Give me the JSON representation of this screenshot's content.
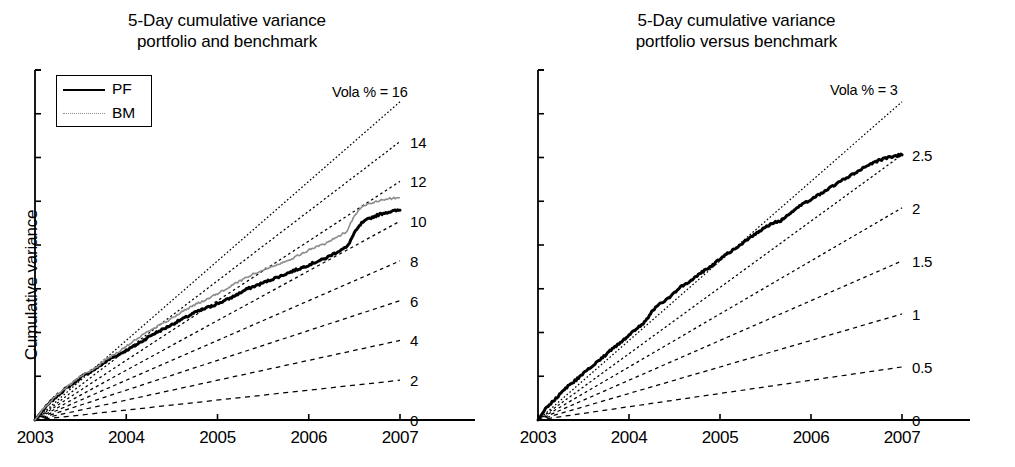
{
  "figure": {
    "background": "#ffffff",
    "ink_color": "#000000",
    "benchmark_color": "#8d8d8d"
  },
  "panels": [
    {
      "id": "left",
      "title": "5-Day cumulative variance\nportfolio and benchmark",
      "ylabel": "Cumulative variance",
      "legend": {
        "items": [
          {
            "label": "PF",
            "style": "solid",
            "color": "#000000"
          },
          {
            "label": "BM",
            "style": "dotted",
            "color": "#8d8d8d"
          }
        ]
      },
      "vola_head_label": "Vola % = 16",
      "vola_labels": [
        "14",
        "12",
        "10",
        "8",
        "6",
        "4",
        "2",
        "0"
      ]
    },
    {
      "id": "right",
      "title": "5-Day cumulative variance\nportfolio versus benchmark",
      "ylabel": "Cumulative variance",
      "vola_head_label": "Vola % = 3",
      "vola_labels": [
        "2.5",
        "2",
        "1.5",
        "1",
        "0.5",
        "0"
      ]
    }
  ],
  "chart_data": [
    {
      "type": "line",
      "panel": "left",
      "title": "5-Day cumulative variance portfolio and benchmark",
      "xlabel": "",
      "ylabel": "Cumulative variance",
      "xticklabels": [
        "2003",
        "2004",
        "2005",
        "2006",
        "2007"
      ],
      "x": [
        2003,
        2004,
        2005,
        2006,
        2007
      ],
      "xlim": [
        2003,
        2007
      ],
      "ylim": [
        0,
        16
      ],
      "yticklabels": [],
      "grid": false,
      "legend_position": "upper-left",
      "annotations": [
        {
          "text": "Vola % = 16",
          "value": 16
        },
        {
          "text": "14",
          "value": 14
        },
        {
          "text": "12",
          "value": 12
        },
        {
          "text": "10",
          "value": 10
        },
        {
          "text": "8",
          "value": 8
        },
        {
          "text": "6",
          "value": 6
        },
        {
          "text": "4",
          "value": 4
        },
        {
          "text": "2",
          "value": 2
        },
        {
          "text": "0",
          "value": 0
        }
      ],
      "reference_lines": {
        "description": "Dashed straight iso-volatility reference lines from origin",
        "style": "dashed",
        "vola_levels": [
          16,
          14,
          12,
          10,
          8,
          6,
          4,
          2
        ],
        "end_values": [
          16,
          14,
          12,
          10,
          8,
          6,
          4,
          2
        ]
      },
      "series": [
        {
          "name": "PF",
          "style": "solid",
          "color": "#000000",
          "x": [
            2003.0,
            2003.08,
            2003.17,
            2003.25,
            2003.33,
            2003.42,
            2003.5,
            2003.58,
            2003.67,
            2003.75,
            2003.83,
            2003.92,
            2004.0,
            2004.08,
            2004.17,
            2004.25,
            2004.33,
            2004.42,
            2004.5,
            2004.58,
            2004.67,
            2004.75,
            2004.83,
            2004.92,
            2005.0,
            2005.08,
            2005.17,
            2005.25,
            2005.33,
            2005.42,
            2005.5,
            2005.58,
            2005.67,
            2005.75,
            2005.83,
            2005.92,
            2006.0,
            2006.08,
            2006.17,
            2006.25,
            2006.33,
            2006.42,
            2006.5,
            2006.58,
            2006.67,
            2006.75,
            2006.83,
            2006.92,
            2007.0
          ],
          "values": [
            0.0,
            0.45,
            0.9,
            1.25,
            1.55,
            1.85,
            2.15,
            2.35,
            2.6,
            2.85,
            3.1,
            3.3,
            3.5,
            3.7,
            3.95,
            4.2,
            4.4,
            4.6,
            4.8,
            5.0,
            5.2,
            5.4,
            5.55,
            5.7,
            5.85,
            6.0,
            6.2,
            6.4,
            6.6,
            6.75,
            6.9,
            7.05,
            7.2,
            7.35,
            7.5,
            7.65,
            7.8,
            7.95,
            8.1,
            8.3,
            8.5,
            8.7,
            9.4,
            9.9,
            10.15,
            10.3,
            10.42,
            10.5,
            10.55
          ]
        },
        {
          "name": "BM",
          "style": "dotted",
          "color": "#8d8d8d",
          "x": [
            2003.0,
            2003.08,
            2003.17,
            2003.25,
            2003.33,
            2003.42,
            2003.5,
            2003.58,
            2003.67,
            2003.75,
            2003.83,
            2003.92,
            2004.0,
            2004.08,
            2004.17,
            2004.25,
            2004.33,
            2004.42,
            2004.5,
            2004.58,
            2004.67,
            2004.75,
            2004.83,
            2004.92,
            2005.0,
            2005.08,
            2005.17,
            2005.25,
            2005.33,
            2005.42,
            2005.5,
            2005.58,
            2005.67,
            2005.75,
            2005.83,
            2005.92,
            2006.0,
            2006.08,
            2006.17,
            2006.25,
            2006.33,
            2006.42,
            2006.5,
            2006.58,
            2006.67,
            2006.75,
            2006.83,
            2006.92,
            2007.0
          ],
          "values": [
            0.0,
            0.5,
            0.95,
            1.3,
            1.6,
            1.9,
            2.2,
            2.4,
            2.65,
            2.95,
            3.2,
            3.45,
            3.7,
            3.95,
            4.25,
            4.5,
            4.7,
            4.9,
            5.1,
            5.35,
            5.6,
            5.8,
            5.95,
            6.15,
            6.35,
            6.55,
            6.8,
            7.0,
            7.2,
            7.4,
            7.55,
            7.7,
            7.85,
            8.0,
            8.15,
            8.35,
            8.55,
            8.7,
            8.85,
            9.05,
            9.25,
            9.5,
            10.3,
            10.7,
            10.9,
            11.0,
            11.1,
            11.15,
            11.2
          ]
        }
      ]
    },
    {
      "type": "line",
      "panel": "right",
      "title": "5-Day cumulative variance portfolio versus benchmark",
      "xlabel": "",
      "ylabel": "Cumulative variance",
      "xticklabels": [
        "2003",
        "2004",
        "2005",
        "2006",
        "2007"
      ],
      "x": [
        2003,
        2004,
        2005,
        2006,
        2007
      ],
      "xlim": [
        2003,
        2007
      ],
      "ylim": [
        0,
        3
      ],
      "yticklabels": [],
      "grid": false,
      "legend_position": "none",
      "annotations": [
        {
          "text": "Vola % = 3",
          "value": 3
        },
        {
          "text": "2.5",
          "value": 2.5
        },
        {
          "text": "2",
          "value": 2
        },
        {
          "text": "1.5",
          "value": 1.5
        },
        {
          "text": "1",
          "value": 1
        },
        {
          "text": "0.5",
          "value": 0.5
        },
        {
          "text": "0",
          "value": 0
        }
      ],
      "reference_lines": {
        "description": "Dashed straight iso-volatility reference lines from origin",
        "style": "dashed",
        "vola_levels": [
          3,
          2.5,
          2,
          1.5,
          1,
          0.5
        ],
        "end_values": [
          3,
          2.5,
          2,
          1.5,
          1,
          0.5
        ]
      },
      "series": [
        {
          "name": "Tracking error",
          "style": "solid",
          "color": "#000000",
          "x": [
            2003.0,
            2003.08,
            2003.17,
            2003.25,
            2003.33,
            2003.42,
            2003.5,
            2003.58,
            2003.67,
            2003.75,
            2003.83,
            2003.92,
            2004.0,
            2004.08,
            2004.17,
            2004.25,
            2004.33,
            2004.42,
            2004.5,
            2004.58,
            2004.67,
            2004.75,
            2004.83,
            2004.92,
            2005.0,
            2005.08,
            2005.17,
            2005.25,
            2005.33,
            2005.42,
            2005.5,
            2005.58,
            2005.67,
            2005.75,
            2005.83,
            2005.92,
            2006.0,
            2006.08,
            2006.17,
            2006.25,
            2006.33,
            2006.42,
            2006.5,
            2006.58,
            2006.67,
            2006.75,
            2006.83,
            2006.92,
            2007.0
          ],
          "values": [
            0.0,
            0.1,
            0.18,
            0.25,
            0.32,
            0.38,
            0.44,
            0.5,
            0.56,
            0.62,
            0.68,
            0.74,
            0.8,
            0.86,
            0.92,
            1.02,
            1.09,
            1.14,
            1.2,
            1.26,
            1.31,
            1.36,
            1.41,
            1.46,
            1.52,
            1.57,
            1.62,
            1.67,
            1.72,
            1.77,
            1.82,
            1.86,
            1.88,
            1.93,
            1.99,
            2.04,
            2.08,
            2.12,
            2.17,
            2.21,
            2.25,
            2.3,
            2.34,
            2.38,
            2.42,
            2.45,
            2.47,
            2.49,
            2.5
          ]
        }
      ]
    }
  ]
}
